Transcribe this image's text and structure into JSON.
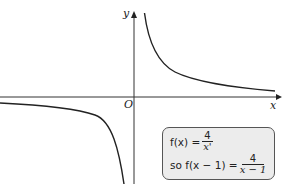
{
  "axes": {
    "x_label": "x",
    "y_label": "y",
    "origin_label": "O"
  },
  "curve": {
    "description": "Rectangular hyperbola y = 4/(x - 1) with vertical asymptote x = 1 and horizontal asymptote y = 0",
    "color": "#222222"
  },
  "note_box": {
    "line1_prefix": "f(x) = ",
    "line1_num": "4",
    "line1_den": "x'",
    "line2_prefix": "so f(x − 1) = ",
    "line2_num": "4",
    "line2_den": "x − 1"
  }
}
